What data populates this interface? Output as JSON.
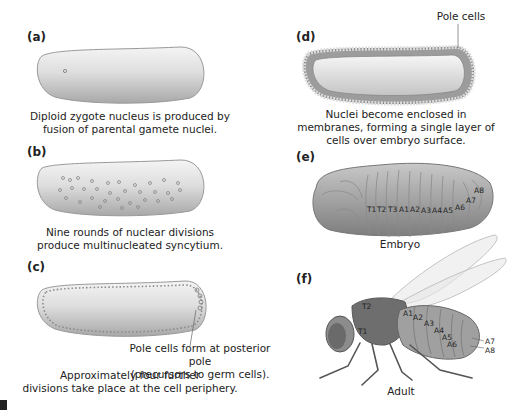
{
  "figure": {
    "panels": [
      {
        "id": "a",
        "label": "(a)",
        "caption": [
          "Diploid zygote nucleus is produced by",
          "fusion of parental gamete nuclei."
        ]
      },
      {
        "id": "b",
        "label": "(b)",
        "caption": [
          "Nine rounds of nuclear divisions",
          "produce multinucleated syncytium."
        ]
      },
      {
        "id": "c",
        "label": "(c)",
        "callout": [
          "Pole cells form at posterior pole",
          "(precursors to germ cells)."
        ],
        "caption": [
          "Approximately four further",
          "divisions take place at the cell periphery."
        ]
      },
      {
        "id": "d",
        "label": "(d)",
        "callout": "Pole cells",
        "caption": [
          "Nuclei become enclosed in",
          "membranes, forming a single layer of",
          "cells over embryo surface."
        ]
      },
      {
        "id": "e",
        "label": "(e)",
        "caption": "Embryo",
        "segments": [
          "T1",
          "T2",
          "T3",
          "A1",
          "A2",
          "A3",
          "A4",
          "A5",
          "A6",
          "A7",
          "A8"
        ]
      },
      {
        "id": "f",
        "label": "(f)",
        "caption": "Adult",
        "segments": [
          "T1",
          "T2",
          "A1",
          "A2",
          "A3",
          "A4",
          "A5",
          "A6",
          "A7",
          "A8"
        ]
      }
    ]
  },
  "colors": {
    "embryo_fill": "#d9d9d9",
    "embryo_shadow": "#9a9a9a",
    "nucleus": "#8a8a8a",
    "text": "#222222"
  }
}
